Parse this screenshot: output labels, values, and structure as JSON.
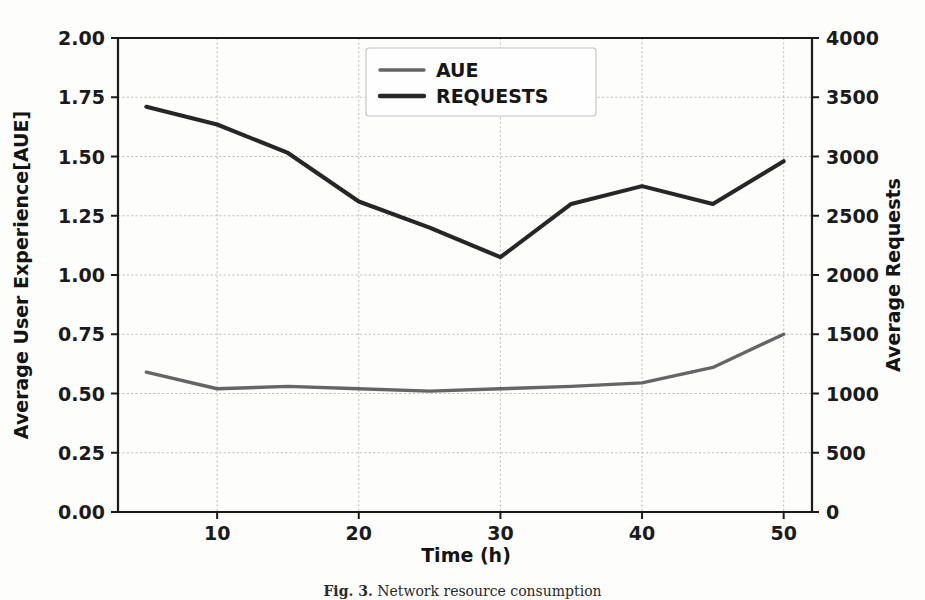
{
  "figure": {
    "caption_label": "Fig. 3.",
    "caption_text": "Network resource consumption"
  },
  "chart_data": {
    "type": "line",
    "title": "",
    "xlabel": "Time (h)",
    "ylabel": "Average User Experience[AUE]",
    "y2label": "Average Requests",
    "x": [
      5,
      10,
      15,
      20,
      25,
      30,
      35,
      40,
      45,
      50
    ],
    "xlim": [
      3,
      52
    ],
    "xticks": [
      10,
      20,
      30,
      40,
      50
    ],
    "xticklabels": [
      "10",
      "20",
      "30",
      "40",
      "50"
    ],
    "ylim": [
      0.0,
      2.0
    ],
    "yticks": [
      0.0,
      0.25,
      0.5,
      0.75,
      1.0,
      1.25,
      1.5,
      1.75,
      2.0
    ],
    "yticklabels": [
      "0.00",
      "0.25",
      "0.50",
      "0.75",
      "1.00",
      "1.25",
      "1.50",
      "1.75",
      "2.00"
    ],
    "y2lim": [
      0,
      4000
    ],
    "y2ticks": [
      0,
      500,
      1000,
      1500,
      2000,
      2500,
      3000,
      3500,
      4000
    ],
    "y2ticklabels": [
      "0",
      "500",
      "1000",
      "1500",
      "2000",
      "2500",
      "3000",
      "3500",
      "4000"
    ],
    "grid": true,
    "legend_position": "upper center",
    "series": [
      {
        "name": "AUE",
        "axis": "left",
        "color": "#656565",
        "values": [
          0.59,
          0.52,
          0.53,
          0.52,
          0.51,
          0.52,
          0.53,
          0.545,
          0.61,
          0.75
        ]
      },
      {
        "name": "REQUESTS",
        "axis": "right",
        "color": "#262626",
        "values": [
          3420,
          3270,
          3030,
          2620,
          2400,
          2150,
          2600,
          2750,
          2600,
          2960
        ]
      }
    ],
    "legend": [
      "AUE",
      "REQUESTS"
    ]
  }
}
